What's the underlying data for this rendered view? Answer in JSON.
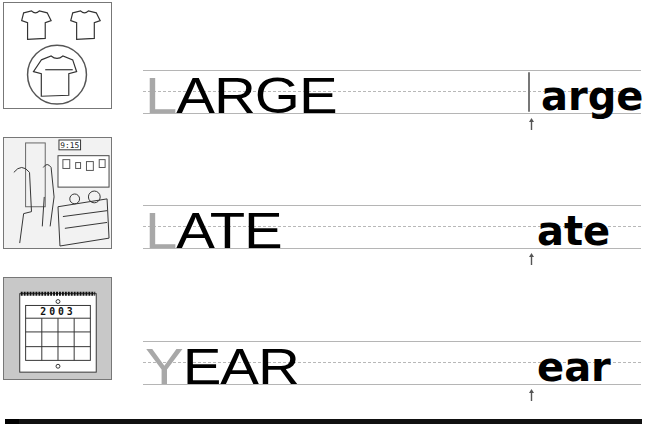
{
  "worksheet": {
    "rows": [
      {
        "picture": "shirts-large-circled",
        "word_first_letter": "L",
        "word_rest": "ARGE",
        "answer_first_letter_hint": "|",
        "answer_rest": "arge"
      },
      {
        "picture": "classroom-late-clock",
        "clock_time": "9:15",
        "word_first_letter": "L",
        "word_rest": "ATE",
        "answer_rest": "ate"
      },
      {
        "picture": "calendar-year",
        "calendar_year": "2003",
        "word_first_letter": "Y",
        "word_rest": "EAR",
        "answer_rest": "ear"
      }
    ],
    "colors": {
      "hint_letter": "#a8a8a8",
      "text": "#000000",
      "guide_line": "#b5b5b5",
      "calendar_bg": "#c8c8c8"
    }
  }
}
